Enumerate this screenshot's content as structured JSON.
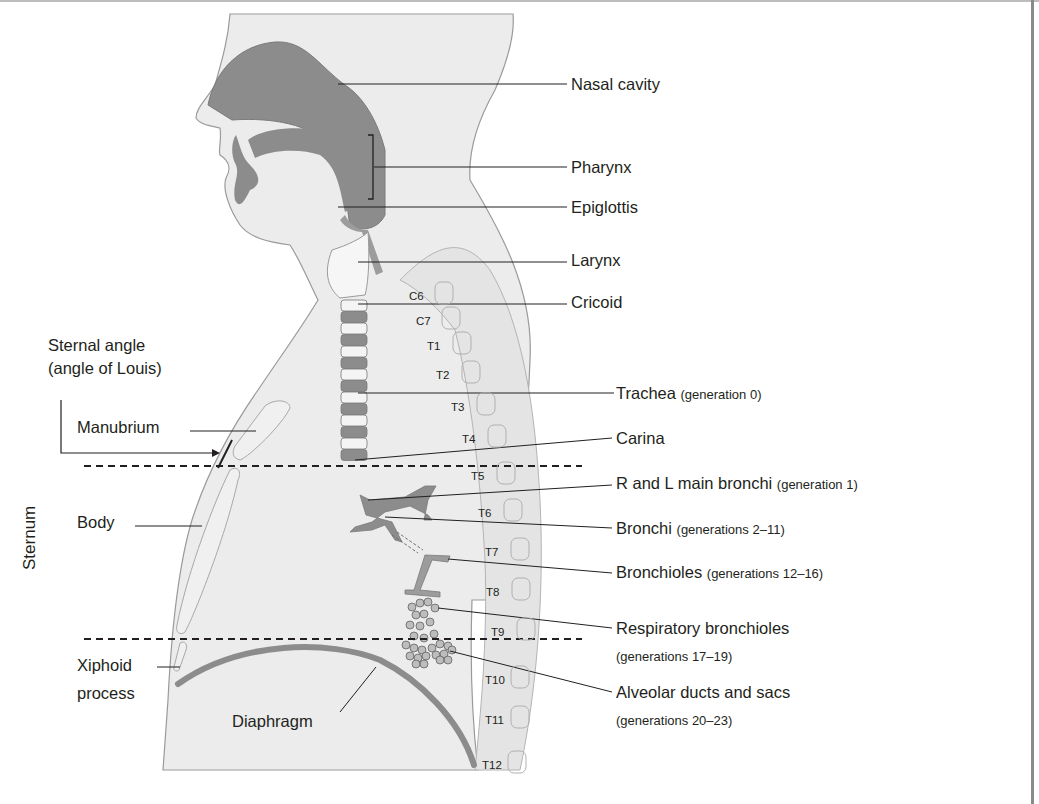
{
  "figure": {
    "right_labels": [
      {
        "name": "Nasal cavity",
        "note": ""
      },
      {
        "name": "Pharynx",
        "note": ""
      },
      {
        "name": "Epiglottis",
        "note": ""
      },
      {
        "name": "Larynx",
        "note": ""
      },
      {
        "name": "Cricoid",
        "note": ""
      },
      {
        "name": "Trachea",
        "note": "(generation 0)"
      },
      {
        "name": "Carina",
        "note": ""
      },
      {
        "name": "R and L main bronchi",
        "note": "(generation 1)"
      },
      {
        "name": "Bronchi",
        "note": "(generations 2–11)"
      },
      {
        "name": "Bronchioles",
        "note": "(generations 12–16)"
      },
      {
        "name": "Respiratory bronchioles",
        "note": "(generations 17–19)"
      },
      {
        "name": "Alveolar ducts and sacs",
        "note": "(generations 20–23)"
      }
    ],
    "left_labels": {
      "sternal_angle_line1": "Sternal angle",
      "sternal_angle_line2": "(angle of Louis)",
      "manubrium": "Manubrium",
      "body": "Body",
      "xiphoid_line1": "Xiphoid",
      "xiphoid_line2": "process",
      "diaphragm": "Diaphragm",
      "sternum": "Sternum"
    },
    "vertebrae": [
      "C6",
      "C7",
      "T1",
      "T2",
      "T3",
      "T4",
      "T5",
      "T6",
      "T7",
      "T8",
      "T9",
      "T10",
      "T11",
      "T12"
    ],
    "colors": {
      "body_fill": "#ececec",
      "airway_fill": "#8c8c8c",
      "outline": "#9a9a9a",
      "text": "#231f20",
      "leader": "#231f20"
    }
  }
}
